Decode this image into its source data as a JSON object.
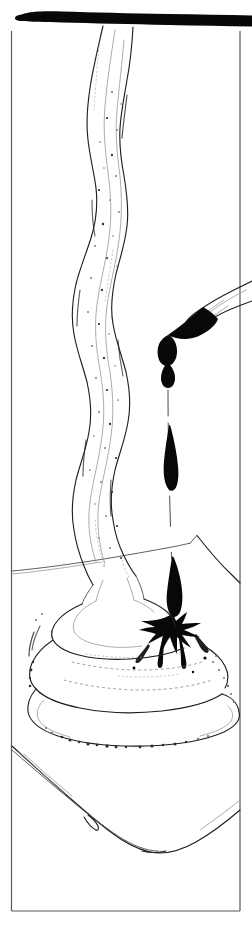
{
  "artwork": {
    "title": "Ink Drop Falling onto Cream Mound",
    "medium": "pen-and-ink line drawing",
    "palette": {
      "background": "#ffffff",
      "ink_black": "#080808",
      "frame_gray": "#555a5e",
      "outline_gray": "#4a4f54",
      "soft_gray": "#8d9298",
      "stipple_gray": "#6e7378"
    },
    "canvas": {
      "width": 252,
      "height": 926
    }
  },
  "frame": {
    "name": "rectangular border",
    "left_x": 11,
    "right_x": 240,
    "top_y": 30,
    "bottom_y": 912,
    "stroke": "#555a5e"
  },
  "top_bar": {
    "name": "black brush stroke bar",
    "description": "thick horizontal ink bar spanning full width with rounded left cap",
    "y": 14,
    "thickness": 13,
    "fill": "#080808"
  },
  "elements": [
    {
      "id": "cream-column",
      "label": "Extruded cream column",
      "description": "tall wavy vertical column of piped cream descending from the top bar to the mound, rendered in thin outlines with stippled dots"
    },
    {
      "id": "brush-tip",
      "label": "Inked brush tip",
      "description": "brush or pen nib entering from the upper right edge, its tip loaded with solid black ink and a drop forming"
    },
    {
      "id": "ink-droplet",
      "label": "Falling ink droplet",
      "description": "teardrop-shaped black ink drop in mid-fall below the brush"
    },
    {
      "id": "drip-trail",
      "label": "Dashed drip trail",
      "description": "thin broken vertical line tracing the fall path of the ink"
    },
    {
      "id": "ink-splash",
      "label": "Ink splash",
      "description": "star-shaped black splash with radiating spikes where the drop strikes the cream"
    },
    {
      "id": "cream-mound",
      "label": "Coiled cream mound",
      "description": "soft-serve style spiral mound of whipped cream with looping contour lines"
    },
    {
      "id": "horizon-line",
      "label": "Background horizon",
      "description": "peaked angular background line suggesting a distant edge or table horizon"
    },
    {
      "id": "base-vessel",
      "label": "Base vessel curve",
      "description": "large shallow curved line at the bottom suggesting a bowl or plate holding the mound"
    }
  ]
}
